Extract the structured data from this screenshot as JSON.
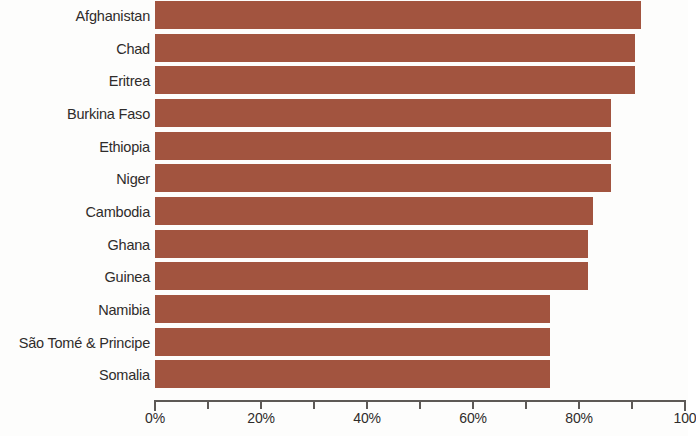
{
  "chart_data": {
    "type": "bar",
    "orientation": "horizontal",
    "title": "",
    "subtitle": "",
    "xlabel": "",
    "ylabel": "",
    "xlim": [
      0,
      100
    ],
    "grid": false,
    "legend": null,
    "bar_color": "#a2543f",
    "axis_color": "#5d5956",
    "text_color": "#2f2c2b",
    "background_color": "#fdfdfc",
    "x_unit": "%",
    "x_ticks": [
      0,
      10,
      20,
      30,
      40,
      50,
      60,
      70,
      80,
      90,
      100
    ],
    "x_tick_labels": [
      "0%",
      "",
      "20%",
      "",
      "40%",
      "",
      "60%",
      "",
      "80%",
      "",
      "100"
    ],
    "categories": [
      "Afghanistan",
      "Chad",
      "Eritrea",
      "Burkina Faso",
      "Ethiopia",
      "Niger",
      "Cambodia",
      "Ghana",
      "Guinea",
      "Namibia",
      "São Tomé & Principe",
      "Somalia"
    ],
    "values": [
      91.7,
      90.5,
      90.5,
      86,
      86,
      86,
      82.6,
      81.7,
      81.7,
      74.5,
      74.5,
      74.5
    ],
    "bars": [
      {
        "label": "Afghanistan",
        "value": 91.7
      },
      {
        "label": "Chad",
        "value": 90.5
      },
      {
        "label": "Eritrea",
        "value": 90.5
      },
      {
        "label": "Burkina Faso",
        "value": 86
      },
      {
        "label": "Ethiopia",
        "value": 86
      },
      {
        "label": "Niger",
        "value": 86
      },
      {
        "label": "Cambodia",
        "value": 82.6
      },
      {
        "label": "Ghana",
        "value": 81.7
      },
      {
        "label": "Guinea",
        "value": 81.7
      },
      {
        "label": "Namibia",
        "value": 74.5
      },
      {
        "label": "São Tomé & Principe",
        "value": 74.5
      },
      {
        "label": "Somalia",
        "value": 74.5
      }
    ]
  }
}
